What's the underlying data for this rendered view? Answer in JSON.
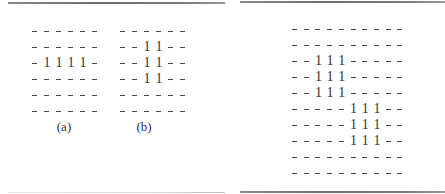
{
  "left_panel": {
    "grids": [
      {
        "label": "(a)",
        "rows": [
          [
            "-",
            "-",
            "-",
            "-",
            "-",
            "-"
          ],
          [
            "-",
            "-",
            "-",
            "-",
            "-",
            "-"
          ],
          [
            "-",
            "1",
            "1",
            "1",
            "1",
            "-"
          ],
          [
            "-",
            "-",
            "-",
            "-",
            "-",
            "-"
          ],
          [
            "-",
            "-",
            "-",
            "-",
            "-",
            "-"
          ],
          [
            "-",
            "-",
            "-",
            "-",
            "-",
            "-"
          ]
        ]
      },
      {
        "label": "(b)",
        "rows": [
          [
            "-",
            "-",
            "-",
            "-",
            "-",
            "-"
          ],
          [
            "-",
            "-",
            "1",
            "1",
            "-",
            "-"
          ],
          [
            "-",
            "-",
            "1",
            "1",
            "-",
            "-"
          ],
          [
            "-",
            "-",
            "1",
            "1",
            "-",
            "-"
          ],
          [
            "-",
            "-",
            "-",
            "-",
            "-",
            "-"
          ],
          [
            "-",
            "-",
            "-",
            "-",
            "-",
            "-"
          ]
        ]
      }
    ]
  },
  "right_panel": {
    "grid": {
      "rows": [
        [
          "-",
          "-",
          "-",
          "-",
          "-",
          "-",
          "-",
          "-",
          "-",
          "-"
        ],
        [
          "-",
          "-",
          "-",
          "-",
          "-",
          "-",
          "-",
          "-",
          "-",
          "-"
        ],
        [
          "-",
          "-",
          "1",
          "1",
          "1",
          "-",
          "-",
          "-",
          "-",
          "-"
        ],
        [
          "-",
          "-",
          "1",
          "1",
          "1",
          "-",
          "-",
          "-",
          "-",
          "-"
        ],
        [
          "-",
          "-",
          "1",
          "1",
          "1",
          "-",
          "-",
          "-",
          "-",
          "-"
        ],
        [
          "-",
          "-",
          "-",
          "-",
          "-",
          "1",
          "1",
          "1",
          "-",
          "-"
        ],
        [
          "-",
          "-",
          "-",
          "-",
          "-",
          "1",
          "1",
          "1",
          "-",
          "-"
        ],
        [
          "-",
          "-",
          "-",
          "-",
          "-",
          "1",
          "1",
          "1",
          "-",
          "-"
        ],
        [
          "-",
          "-",
          "-",
          "-",
          "-",
          "-",
          "-",
          "-",
          "-",
          "-"
        ],
        [
          "-",
          "-",
          "-",
          "-",
          "-",
          "-",
          "-",
          "-",
          "-",
          "-"
        ]
      ]
    }
  },
  "colors": {
    "rule_dark": "#7a7a7a",
    "text": "#2a2a2a"
  }
}
